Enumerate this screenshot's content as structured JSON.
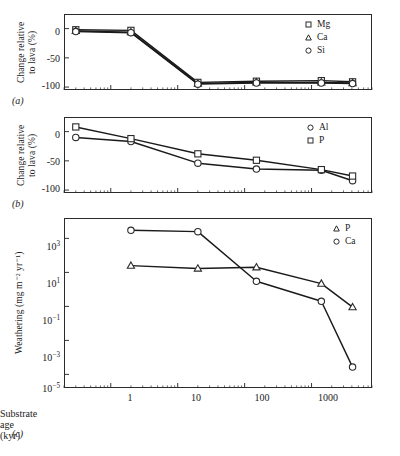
{
  "figure": {
    "xlabel": "Substrate age (kyr)",
    "panel_labels": {
      "a": "(a)",
      "b": "(b)",
      "c": "(c)"
    },
    "x_ticks": [
      "1",
      "10",
      "100",
      "1000"
    ],
    "x_tick_values": [
      1,
      10,
      100,
      1000
    ],
    "x_range": [
      0.2,
      8000
    ]
  },
  "panel_a": {
    "ylabel_line1": "Change relative",
    "ylabel_line2": "to lava (%)",
    "y_ticks": [
      "0",
      "-50",
      "-100"
    ],
    "legend": [
      {
        "label": "Mg",
        "marker": "square"
      },
      {
        "label": "Ca",
        "marker": "triangle"
      },
      {
        "label": "Si",
        "marker": "circle"
      }
    ]
  },
  "panel_b": {
    "ylabel_line1": "Change relative",
    "ylabel_line2": "to lava (%)",
    "y_ticks": [
      "0",
      "-50",
      "-100"
    ],
    "legend": [
      {
        "label": "Al",
        "marker": "circle"
      },
      {
        "label": "P",
        "marker": "square"
      }
    ]
  },
  "panel_c": {
    "ylabel": "Weathering (mg m⁻² yr⁻¹)",
    "y_ticks": [
      "10³",
      "10¹",
      "10⁻¹",
      "10⁻³",
      "10⁻⁵"
    ],
    "legend": [
      {
        "label": "P",
        "marker": "triangle"
      },
      {
        "label": "Ca",
        "marker": "circle"
      }
    ]
  },
  "chart_data": [
    {
      "type": "line",
      "panel": "a",
      "title": "",
      "xlabel": "Substrate age (kyr)",
      "ylabel": "Change relative to lava (%)",
      "xscale": "log",
      "xlim": [
        0.2,
        8000
      ],
      "ylim": [
        -105,
        25
      ],
      "yticks": [
        0,
        -50,
        -100
      ],
      "grid": false,
      "legend_position": "top-right",
      "x": [
        0.3,
        2,
        20,
        150,
        1400,
        4100
      ],
      "series": [
        {
          "name": "Mg",
          "marker": "square",
          "values": [
            -2,
            -3,
            -92,
            -90,
            -89,
            -91
          ]
        },
        {
          "name": "Ca",
          "marker": "triangle",
          "values": [
            -4,
            -6,
            -94,
            -92,
            -92,
            -93
          ]
        },
        {
          "name": "Si",
          "marker": "circle",
          "values": [
            -5,
            -7,
            -95,
            -93,
            -93,
            -94
          ]
        }
      ]
    },
    {
      "type": "line",
      "panel": "b",
      "title": "",
      "xlabel": "Substrate age (kyr)",
      "ylabel": "Change relative to lava (%)",
      "xscale": "log",
      "xlim": [
        0.2,
        8000
      ],
      "ylim": [
        -105,
        25
      ],
      "yticks": [
        0,
        -50,
        -100
      ],
      "grid": false,
      "legend_position": "top-right",
      "x": [
        0.3,
        2,
        20,
        150,
        1400,
        4100
      ],
      "series": [
        {
          "name": "Al",
          "marker": "circle",
          "values": [
            -10,
            -17,
            -54,
            -64,
            -66,
            -84
          ]
        },
        {
          "name": "P",
          "marker": "square",
          "values": [
            8,
            -12,
            -38,
            -49,
            -65,
            -76
          ]
        }
      ]
    },
    {
      "type": "line",
      "panel": "c",
      "title": "",
      "xlabel": "Substrate age (kyr)",
      "ylabel": "Weathering (mg m⁻² yr⁻¹)",
      "xscale": "log",
      "yscale": "log",
      "xlim": [
        0.2,
        8000
      ],
      "ylim": [
        1e-05,
        10000.0
      ],
      "yticks": [
        1000,
        10,
        0.1,
        0.001,
        1e-05
      ],
      "grid": false,
      "legend_position": "top-right",
      "series": [
        {
          "name": "P",
          "marker": "triangle",
          "x": [
            2,
            20,
            150,
            1400,
            4100
          ],
          "values": [
            25,
            17,
            20,
            2.2,
            0.09
          ]
        },
        {
          "name": "Ca",
          "marker": "circle",
          "x": [
            2,
            20,
            150,
            1400,
            4100
          ],
          "values": [
            3000,
            2500,
            3.0,
            0.2,
            2.7e-05
          ]
        }
      ]
    }
  ]
}
